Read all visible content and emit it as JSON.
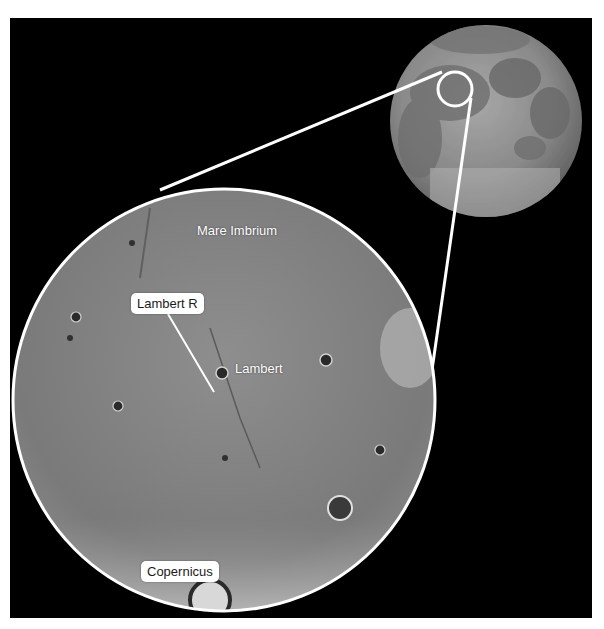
{
  "figure": {
    "background_color": "#000000",
    "callout_line_color": "#ffffff"
  },
  "labels": {
    "mare_imbrium": "Mare Imbrium",
    "lambert_r": "Lambert R",
    "lambert": "Lambert",
    "copernicus": "Copernicus"
  }
}
